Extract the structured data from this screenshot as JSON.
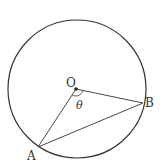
{
  "diagram": {
    "type": "geometry",
    "colors": {
      "stroke": "#333333",
      "background": "#ffffff"
    },
    "circle": {
      "cx": 77,
      "cy": 89,
      "r": 69
    },
    "points": {
      "O": {
        "label": "O",
        "x": 76,
        "y": 89
      },
      "A": {
        "label": "A",
        "x": 38,
        "y": 147
      },
      "B": {
        "label": "B",
        "x": 143,
        "y": 103
      }
    },
    "segments": [
      {
        "from": "O",
        "to": "A"
      },
      {
        "from": "O",
        "to": "B"
      },
      {
        "from": "A",
        "to": "B"
      }
    ],
    "angle": {
      "vertex": "O",
      "label": "θ"
    }
  }
}
